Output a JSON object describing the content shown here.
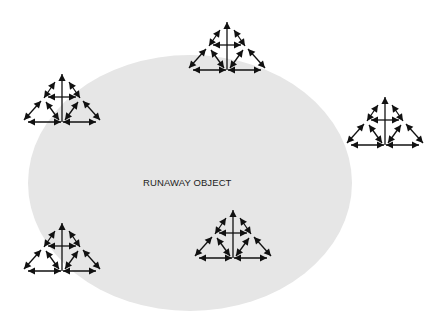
{
  "diagram": {
    "background": "#ffffff",
    "object": {
      "label": "RUNAWAY OBJECT",
      "shape": "ellipse",
      "fill": "#e6e6e6",
      "cx": 190,
      "cy": 183,
      "rx": 162,
      "ry": 128,
      "label_x": 143,
      "label_y": 177
    },
    "glyph_icon": "triangle-of-double-headed-arrows",
    "glyph_color": "#111111",
    "glyphs": [
      {
        "name": "top",
        "x": 185,
        "y": 20
      },
      {
        "name": "left",
        "x": 20,
        "y": 72
      },
      {
        "name": "right",
        "x": 343,
        "y": 95
      },
      {
        "name": "bottom-center",
        "x": 191,
        "y": 208
      },
      {
        "name": "bottom-left",
        "x": 20,
        "y": 221
      }
    ]
  }
}
